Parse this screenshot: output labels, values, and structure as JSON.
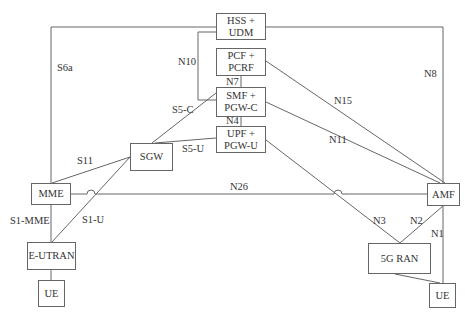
{
  "diagram": {
    "nodes": {
      "hss": {
        "label": "HSS +\nUDM"
      },
      "pcf": {
        "label": "PCF +\nPCRF"
      },
      "smf": {
        "label": "SMF +\nPGW-C"
      },
      "upf": {
        "label": "UPF +\nPGW-U"
      },
      "sgw": {
        "label": "SGW"
      },
      "mme": {
        "label": "MME"
      },
      "eutran": {
        "label": "E-UTRAN"
      },
      "ue_left": {
        "label": "UE"
      },
      "amf": {
        "label": "AMF"
      },
      "ran5g": {
        "label": "5G RAN"
      },
      "ue_right": {
        "label": "UE"
      }
    },
    "interfaces": {
      "s6a": "S6a",
      "n10": "N10",
      "n7": "N7",
      "n4": "N4",
      "s5c": "S5-C",
      "s5u": "S5-U",
      "s11": "S11",
      "n26": "N26",
      "s1mme": "S1-MME",
      "s1u": "S1-U",
      "n8": "N8",
      "n15": "N15",
      "n11": "N11",
      "n3": "N3",
      "n2": "N2",
      "n1": "N1"
    },
    "line_color": "#666666"
  }
}
